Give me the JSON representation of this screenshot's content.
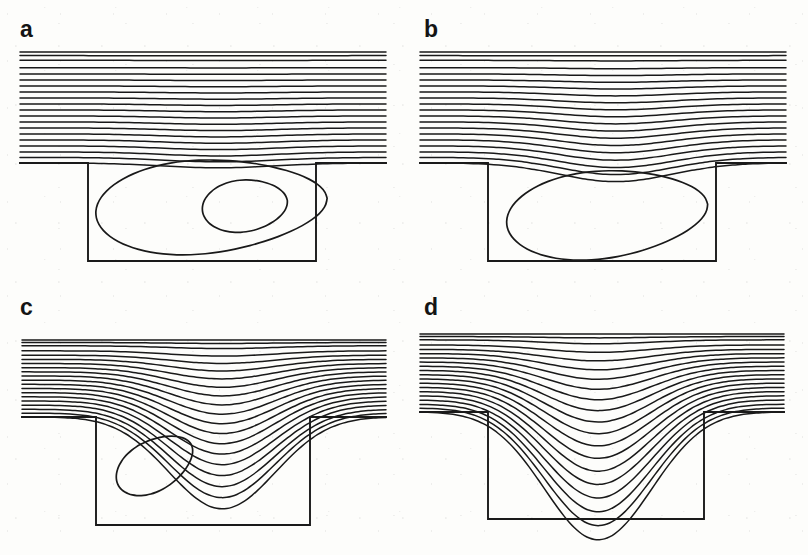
{
  "figure": {
    "layout": "2x2 panel grid",
    "background_color": "#fdfdfb",
    "line_color": "#191919"
  },
  "panels": [
    {
      "id": "a",
      "label": "a",
      "streamline_count": 20,
      "cavity_vortex": "large recirculation filling the cavity with one nested inner contour",
      "inner_contour_count": 1,
      "penetration": "none",
      "vortex_center": [
        0.55,
        0.4
      ]
    },
    {
      "id": "b",
      "label": "b",
      "streamline_count": 20,
      "cavity_vortex": "single large recirculation, dividing streamline dips into cavity mouth",
      "inner_contour_count": 0,
      "penetration": "slight",
      "vortex_center": [
        0.47,
        0.52
      ]
    },
    {
      "id": "c",
      "label": "c",
      "streamline_count": 20,
      "cavity_vortex": "small tilted elliptical vortex near the upstream wall",
      "inner_contour_count": 0,
      "penetration": "deep",
      "vortex_center": [
        0.26,
        0.33
      ]
    },
    {
      "id": "d",
      "label": "d",
      "streamline_count": 20,
      "cavity_vortex": "no closed vortex; streamlines sweep through the cavity",
      "inner_contour_count": 0,
      "penetration": "full",
      "vortex_center": null
    }
  ],
  "chart_data": {
    "type": "line",
    "xlabel": "",
    "ylabel": "",
    "subplot_labels": [
      "a",
      "b",
      "c",
      "d"
    ],
    "grid": false,
    "legend": "none",
    "axis_visible": false,
    "series_per_panel": 20,
    "geometry": {
      "channel_top_y": 47,
      "channel_bottom_y": 163,
      "cavity_left_x": 88,
      "cavity_right_x": 316,
      "cavity_bottom_y": 261,
      "domain_left_x": 20,
      "domain_right_x": 386
    },
    "panels": [
      {
        "label": "a",
        "streamline_levels": [
          1.0,
          0.95,
          0.9,
          0.85,
          0.8,
          0.75,
          0.7,
          0.65,
          0.6,
          0.55,
          0.5,
          0.45,
          0.4,
          0.35,
          0.3,
          0.25,
          0.2,
          0.15,
          0.1,
          0.05
        ],
        "max_dip_fraction": 0.02,
        "vortex_levels": [
          -0.004,
          -0.012
        ],
        "vortex_extent": [
          0.1,
          0.96,
          0.06,
          0.88
        ]
      },
      {
        "label": "b",
        "streamline_levels": [
          1.0,
          0.95,
          0.9,
          0.85,
          0.8,
          0.75,
          0.7,
          0.65,
          0.6,
          0.55,
          0.5,
          0.45,
          0.4,
          0.35,
          0.3,
          0.25,
          0.2,
          0.15,
          0.1,
          0.05
        ],
        "max_dip_fraction": 0.22,
        "vortex_levels": [
          -0.006
        ],
        "vortex_extent": [
          0.08,
          0.88,
          0.1,
          0.82
        ]
      },
      {
        "label": "c",
        "streamline_levels": [
          1.0,
          0.95,
          0.9,
          0.85,
          0.8,
          0.75,
          0.7,
          0.65,
          0.6,
          0.55,
          0.5,
          0.45,
          0.4,
          0.35,
          0.3,
          0.25,
          0.2,
          0.15,
          0.1,
          0.05
        ],
        "max_dip_fraction": 0.52,
        "vortex_levels": [
          -0.002
        ],
        "vortex_extent": [
          0.12,
          0.45,
          0.14,
          0.52
        ]
      },
      {
        "label": "d",
        "streamline_levels": [
          1.0,
          0.95,
          0.9,
          0.85,
          0.8,
          0.75,
          0.7,
          0.65,
          0.6,
          0.55,
          0.5,
          0.45,
          0.4,
          0.35,
          0.3,
          0.25,
          0.2,
          0.15,
          0.1,
          0.05
        ],
        "max_dip_fraction": 0.78,
        "vortex_levels": [],
        "vortex_extent": null
      }
    ]
  }
}
